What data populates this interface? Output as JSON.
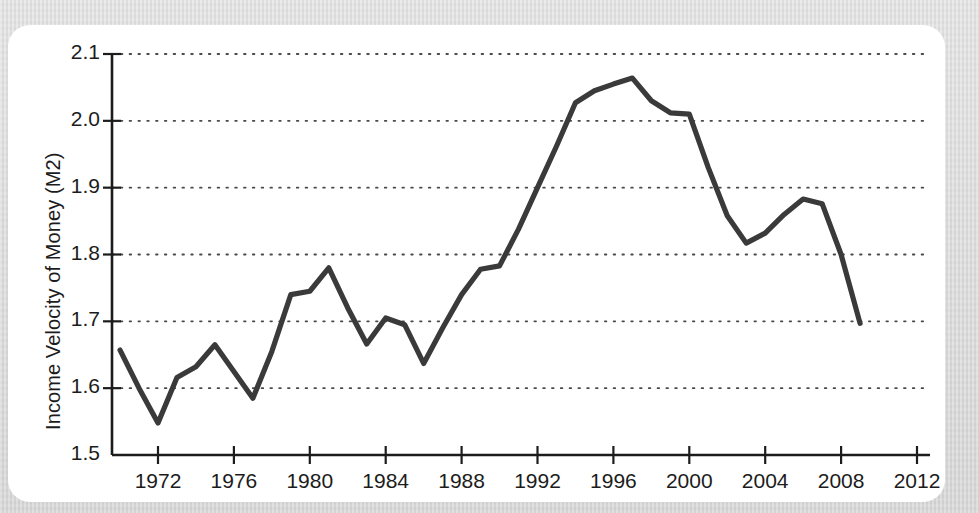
{
  "figure": {
    "background_color": "#ffffff",
    "surround_color": "#d8d8d8",
    "line_color": "#3a3a3a",
    "grid_color": "#4a4a4a",
    "axis_color": "#1c1c1c"
  },
  "chart_data": {
    "type": "line",
    "title": "",
    "subtitle": "",
    "xlabel": "",
    "ylabel": "Income Velocity of Money (M2)",
    "xlim": [
      1969,
      2013.2
    ],
    "ylim": [
      1.5,
      2.12
    ],
    "x_ticks": [
      1972,
      1976,
      1980,
      1984,
      1988,
      1992,
      1996,
      2000,
      2004,
      2008,
      2012
    ],
    "x_tick_labels": [
      "1972",
      "1976",
      "1980",
      "1984",
      "1988",
      "1992",
      "1996",
      "2000",
      "2004",
      "2008",
      "2012"
    ],
    "y_ticks": [
      1.5,
      1.6,
      1.7,
      1.8,
      1.9,
      2.0,
      2.1
    ],
    "y_tick_labels": [
      "1.5",
      "1.6",
      "1.7",
      "1.8",
      "1.9",
      "2.0",
      "2.1"
    ],
    "grid": "horizontal-dotted",
    "legend": "none",
    "series": [
      {
        "name": "Income Velocity of Money (M2)",
        "x": [
          1970,
          1971,
          1972,
          1973,
          1974,
          1975,
          1976,
          1977,
          1978,
          1979,
          1980,
          1981,
          1982,
          1983,
          1984,
          1985,
          1986,
          1987,
          1988,
          1989,
          1990,
          1991,
          1992,
          1993,
          1994,
          1995,
          1996,
          1997,
          1998,
          1999,
          2000,
          2001,
          2002,
          2003,
          2004,
          2005,
          2006,
          2007,
          2008,
          2009
        ],
        "values": [
          1.657,
          1.6,
          1.548,
          1.616,
          1.632,
          1.665,
          1.625,
          1.585,
          1.655,
          1.74,
          1.745,
          1.78,
          1.72,
          1.666,
          1.705,
          1.695,
          1.637,
          1.69,
          1.74,
          1.778,
          1.783,
          1.838,
          1.9,
          1.962,
          2.027,
          2.045,
          2.055,
          2.064,
          2.03,
          2.012,
          2.01,
          1.93,
          1.858,
          1.817,
          1.832,
          1.86,
          1.883,
          1.876,
          1.8,
          1.697
        ]
      }
    ]
  }
}
